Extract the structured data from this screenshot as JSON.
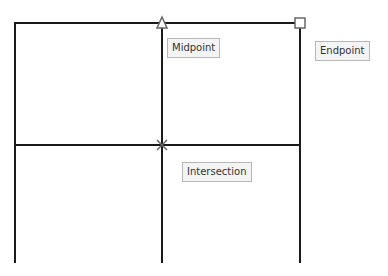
{
  "tooltips": {
    "midpoint": "Midpoint",
    "endpoint": "Endpoint",
    "intersection": "Intersection"
  },
  "snap_markers": {
    "midpoint": "triangle-snap-marker",
    "endpoint": "square-snap-marker",
    "intersection": "x-snap-marker"
  },
  "colors": {
    "line": "#1a1a1a",
    "marker": "#666666",
    "tooltip_bg": "#f4f4f4",
    "tooltip_border": "#b8b8b8"
  }
}
